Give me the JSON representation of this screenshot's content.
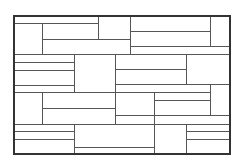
{
  "diagram": {
    "title": "",
    "width": 242,
    "height": 165,
    "colors": {
      "background": "#ffffff",
      "border": "#333333",
      "line": "#555555"
    },
    "outer_border": {
      "x": 14,
      "y": 16,
      "w": 216,
      "h": 138,
      "stroke_width": 2
    },
    "lines": [
      {
        "x1": 14,
        "y1": 23,
        "x2": 98,
        "y2": 23
      },
      {
        "x1": 98,
        "y1": 16,
        "x2": 98,
        "y2": 39
      },
      {
        "x1": 42,
        "y1": 23,
        "x2": 42,
        "y2": 54
      },
      {
        "x1": 42,
        "y1": 39,
        "x2": 130,
        "y2": 39
      },
      {
        "x1": 130,
        "y1": 16,
        "x2": 130,
        "y2": 54
      },
      {
        "x1": 130,
        "y1": 31,
        "x2": 210,
        "y2": 31
      },
      {
        "x1": 210,
        "y1": 16,
        "x2": 210,
        "y2": 46
      },
      {
        "x1": 130,
        "y1": 46,
        "x2": 230,
        "y2": 46
      },
      {
        "x1": 14,
        "y1": 54,
        "x2": 230,
        "y2": 54
      },
      {
        "x1": 14,
        "y1": 62,
        "x2": 74,
        "y2": 62
      },
      {
        "x1": 14,
        "y1": 70,
        "x2": 74,
        "y2": 70
      },
      {
        "x1": 14,
        "y1": 85,
        "x2": 74,
        "y2": 85
      },
      {
        "x1": 74,
        "y1": 54,
        "x2": 74,
        "y2": 92
      },
      {
        "x1": 115,
        "y1": 54,
        "x2": 115,
        "y2": 124
      },
      {
        "x1": 115,
        "y1": 69,
        "x2": 186,
        "y2": 69
      },
      {
        "x1": 186,
        "y1": 54,
        "x2": 186,
        "y2": 84
      },
      {
        "x1": 115,
        "y1": 84,
        "x2": 230,
        "y2": 84
      },
      {
        "x1": 14,
        "y1": 92,
        "x2": 210,
        "y2": 92
      },
      {
        "x1": 42,
        "y1": 92,
        "x2": 42,
        "y2": 124
      },
      {
        "x1": 42,
        "y1": 108,
        "x2": 115,
        "y2": 108
      },
      {
        "x1": 154,
        "y1": 92,
        "x2": 154,
        "y2": 154
      },
      {
        "x1": 154,
        "y1": 100,
        "x2": 210,
        "y2": 100
      },
      {
        "x1": 210,
        "y1": 84,
        "x2": 210,
        "y2": 115
      },
      {
        "x1": 115,
        "y1": 115,
        "x2": 230,
        "y2": 115
      },
      {
        "x1": 14,
        "y1": 124,
        "x2": 230,
        "y2": 124
      },
      {
        "x1": 14,
        "y1": 131,
        "x2": 74,
        "y2": 131
      },
      {
        "x1": 14,
        "y1": 139,
        "x2": 74,
        "y2": 139
      },
      {
        "x1": 74,
        "y1": 124,
        "x2": 74,
        "y2": 154
      },
      {
        "x1": 74,
        "y1": 147,
        "x2": 154,
        "y2": 147
      },
      {
        "x1": 186,
        "y1": 124,
        "x2": 186,
        "y2": 154
      },
      {
        "x1": 186,
        "y1": 131,
        "x2": 230,
        "y2": 131
      },
      {
        "x1": 186,
        "y1": 139,
        "x2": 230,
        "y2": 139
      }
    ]
  }
}
